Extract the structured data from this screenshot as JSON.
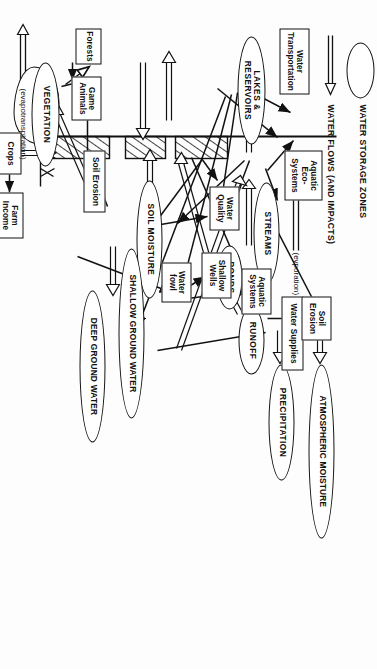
{
  "diagram": {
    "orientation": "rotated-90-clockwise",
    "legend": {
      "storage_label": "WATER STORAGE ZONES",
      "flows_label": "WATER FLOWS (AND IMPACTS)"
    },
    "annotations": [
      {
        "id": "evaporation",
        "text": "(evporation)"
      },
      {
        "id": "evapotranspiration",
        "text": "(evapotranspiration)"
      }
    ],
    "storage_zones": [
      {
        "id": "lakes",
        "label": "LAKES &\nRESERVOIRS"
      },
      {
        "id": "streams",
        "label": "STREAMS"
      },
      {
        "id": "ponds",
        "label": "PONDS"
      },
      {
        "id": "runoff",
        "label": "RUNOFF"
      },
      {
        "id": "precipitation",
        "label": "PRECIPITATION"
      },
      {
        "id": "atmospheric",
        "label": "ATMOSPHERIC MOISTURE"
      },
      {
        "id": "soil_moisture",
        "label": "SOIL MOISTURE"
      },
      {
        "id": "shallow_gw",
        "label": "SHALLOW GROUND WATER"
      },
      {
        "id": "deep_gw",
        "label": "DEEP GROUND WATER"
      },
      {
        "id": "vegetation",
        "label": "VEGETATION"
      }
    ],
    "impact_boxes": [
      {
        "id": "water_transportation",
        "label": "Water\nTransportation"
      },
      {
        "id": "aquatic_eco_systems",
        "label": "Aquatic\nEco-\nSystems"
      },
      {
        "id": "water_quality",
        "label": "Water\nQuality"
      },
      {
        "id": "water_fowl",
        "label": "Water\nfowl"
      },
      {
        "id": "water_supplies",
        "label": "Water Supplies"
      },
      {
        "id": "aquatic_systems",
        "label": "Aquatic\nSystems"
      },
      {
        "id": "shallow_wells",
        "label": "Shallow\nWells"
      },
      {
        "id": "soil_erosion_upper",
        "label": "Soil\nErosion"
      },
      {
        "id": "soil_erosion_lower",
        "label": "Soil Erosion"
      },
      {
        "id": "forests",
        "label": "Forests"
      },
      {
        "id": "game_animals",
        "label": "Game\nAnimals"
      },
      {
        "id": "crops",
        "label": "Crops"
      },
      {
        "id": "farm_income",
        "label": "Farm\nIncome"
      }
    ]
  }
}
